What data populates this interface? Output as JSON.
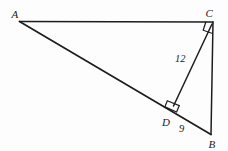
{
  "figure": {
    "background_color": "#fdfdfd",
    "stroke_color": "#1d1d1d",
    "label_color": "#1a1a1a",
    "vertices": [
      {
        "name": "A",
        "label": "A",
        "x": 19.5,
        "y": 21.5,
        "label_x": 11.5,
        "label_y": 17.5
      },
      {
        "name": "C",
        "label": "C",
        "x": 213.0,
        "y": 22.0,
        "label_x": 205.5,
        "label_y": 16.5
      },
      {
        "name": "B",
        "label": "B",
        "x": 211.0,
        "y": 134.5,
        "label_x": 208.5,
        "label_y": 148.0
      },
      {
        "name": "D",
        "label": "D",
        "x": 173.0,
        "y": 106.5,
        "label_x": 162.0,
        "label_y": 126.0
      }
    ],
    "segments": [
      {
        "name": "segment-AC",
        "from": "A",
        "to": "C",
        "x1": 19.5,
        "y1": 21.5,
        "x2": 213.0,
        "y2": 22.0
      },
      {
        "name": "segment-AB",
        "from": "A",
        "to": "B",
        "x1": 19.5,
        "y1": 21.5,
        "x2": 211.0,
        "y2": 134.5
      },
      {
        "name": "segment-CB",
        "from": "C",
        "to": "B",
        "x1": 213.0,
        "y1": 22.0,
        "x2": 211.0,
        "y2": 134.5
      },
      {
        "name": "segment-CD",
        "from": "C",
        "to": "D",
        "x1": 212.0,
        "y1": 24.0,
        "x2": 173.5,
        "y2": 106.0
      }
    ],
    "right_angles": [
      {
        "name": "right-angle-at-C",
        "at": "C",
        "points": "212.5,33.5 203.0,30.0 205.7,21.8"
      },
      {
        "name": "right-angle-at-D",
        "at": "D",
        "points": "167.2,101.0 179.2,105.8 176.5,112.0 164.8,107.0"
      }
    ],
    "measures": [
      {
        "name": "measure-CD",
        "value": "12",
        "segment": "CD",
        "x": 175.0,
        "y": 62.0
      },
      {
        "name": "measure-DB",
        "value": "9",
        "segment": "DB",
        "x": 179.0,
        "y": 132.0
      }
    ]
  }
}
